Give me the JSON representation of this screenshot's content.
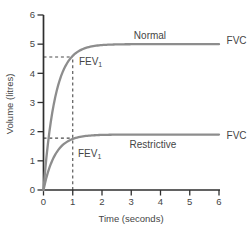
{
  "figure": {
    "background": "#ffffff",
    "text_color": "#454545",
    "axis_color": "#2f2f2f",
    "dash_color": "#4a4a4a",
    "curve_color": "#8d8d8d"
  },
  "chart_data": {
    "type": "line",
    "title": "",
    "xlabel": "Time (seconds)",
    "ylabel": "Volume (litres)",
    "xlim": [
      0,
      6
    ],
    "ylim": [
      0,
      6
    ],
    "x_ticks": [
      0,
      1,
      2,
      3,
      4,
      5,
      6
    ],
    "y_ticks": [
      0,
      1,
      2,
      3,
      4,
      5,
      6
    ],
    "grid": false,
    "legend": "inline-labels",
    "series": [
      {
        "name": "Normal",
        "fvc": 5.0,
        "fev1": 4.6,
        "x": [
          0,
          0.1,
          0.2,
          0.3,
          0.4,
          0.5,
          0.6,
          0.8,
          1,
          1.25,
          1.5,
          2,
          2.5,
          3,
          4,
          5,
          6
        ],
        "y": [
          0,
          1.12,
          1.98,
          2.66,
          3.18,
          3.59,
          3.9,
          4.34,
          4.6,
          4.79,
          4.89,
          4.97,
          4.99,
          5.0,
          5.0,
          5.0,
          5.0
        ]
      },
      {
        "name": "Restrictive",
        "fvc": 1.9,
        "fev1": 1.75,
        "x": [
          0,
          0.1,
          0.2,
          0.3,
          0.4,
          0.5,
          0.6,
          0.8,
          1,
          1.25,
          1.5,
          2,
          2.5,
          3,
          4,
          5,
          6
        ],
        "y": [
          0,
          0.43,
          0.76,
          1.01,
          1.21,
          1.37,
          1.49,
          1.65,
          1.75,
          1.82,
          1.86,
          1.89,
          1.9,
          1.9,
          1.9,
          1.9,
          1.9
        ]
      }
    ],
    "guides": [
      {
        "name": "normal-fev1-dashed-horizontal",
        "from": [
          0,
          4.56
        ],
        "to": [
          1,
          4.56
        ],
        "style": "dashed"
      },
      {
        "name": "fev1-dashed-vertical",
        "from": [
          1,
          0
        ],
        "to": [
          1,
          4.56
        ],
        "style": "dashed"
      },
      {
        "name": "restrictive-fev1-dashed-horizontal",
        "from": [
          0,
          1.78
        ],
        "to": [
          1,
          1.78
        ],
        "style": "dashed"
      }
    ],
    "annotations": [
      {
        "name": "normal-curve-label",
        "text": "Normal",
        "t": 3.64,
        "v": 5.18,
        "anchor": "middle"
      },
      {
        "name": "normal-fvc-label",
        "text": "FVC",
        "t": 6.26,
        "v": 5.0,
        "anchor": "start"
      },
      {
        "name": "normal-fev1-label",
        "text": "FEV",
        "sub": "1",
        "t": 1.21,
        "v": 4.28,
        "anchor": "start"
      },
      {
        "name": "restrictive-curve-label",
        "text": "Restrictive",
        "t": 3.74,
        "v": 1.44,
        "anchor": "middle"
      },
      {
        "name": "restrictive-fvc-label",
        "text": "FVC",
        "t": 6.26,
        "v": 1.75,
        "anchor": "start"
      },
      {
        "name": "restrictive-fev1-label",
        "text": "FEV",
        "sub": "1",
        "t": 1.18,
        "v": 1.12,
        "anchor": "start"
      }
    ]
  }
}
